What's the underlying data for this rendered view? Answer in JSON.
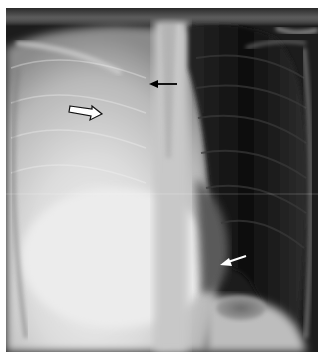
{
  "image": {
    "type": "chest-radiograph",
    "view": "frontal",
    "description": "Frontal chest X-ray with opacified right hemithorax and three annotation arrows",
    "colors": {
      "background": "#ffffff",
      "lung_dark": "#121212",
      "opacity_bright": "#e8e8e8"
    }
  },
  "annotations": [
    {
      "id": "black-arrow",
      "style": "solid-black",
      "direction": "left",
      "x1": 177,
      "y1": 84,
      "x2": 150,
      "y2": 84
    },
    {
      "id": "open-arrow",
      "style": "outlined-hollow",
      "direction": "right",
      "x1": 70,
      "y1": 108,
      "x2": 100,
      "y2": 113
    },
    {
      "id": "white-arrow",
      "style": "solid-white",
      "direction": "down-left",
      "x1": 246,
      "y1": 256,
      "x2": 220,
      "y2": 264
    }
  ]
}
